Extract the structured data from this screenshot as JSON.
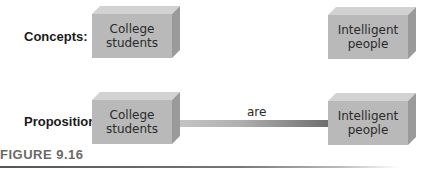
{
  "rows": {
    "concepts": {
      "label": "Concepts:",
      "left_box": [
        "College",
        "students"
      ],
      "right_box": [
        "Intelligent",
        "people"
      ]
    },
    "proposition": {
      "label": "Proposition:",
      "left_box": [
        "College",
        "students"
      ],
      "right_box": [
        "Intelligent",
        "people"
      ],
      "link_label": "are"
    }
  },
  "caption": "FIGURE 9.16",
  "colors": {
    "box_front": "#b9b9b9",
    "box_top": "#d2d2d2",
    "box_side": "#9a9a9a",
    "link_start": "#c4c4c4",
    "link_end": "#6e6e6e",
    "caption": "#6a6a6a"
  }
}
